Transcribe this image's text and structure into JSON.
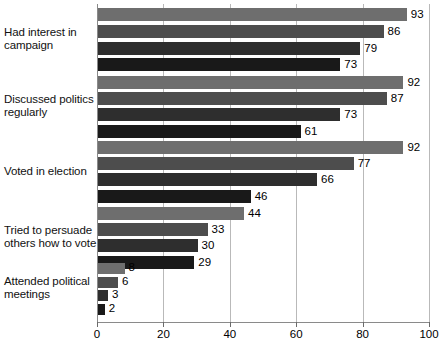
{
  "chart_data": {
    "type": "bar",
    "orientation": "horizontal",
    "title": "",
    "subtitle": "",
    "xlabel": "",
    "ylabel": "",
    "xlim": [
      0,
      100
    ],
    "xticks": [
      0,
      20,
      40,
      60,
      80,
      100
    ],
    "grid": true,
    "legend_position": "none",
    "categories": [
      "Had interest in campaign",
      "Discussed politics regularly",
      "Voted in election",
      "Tried to persuade others how to vote",
      "Attended political meetings"
    ],
    "category_lines": [
      [
        "Had interest in",
        "campaign"
      ],
      [
        "Discussed politics",
        "regularly"
      ],
      [
        "Voted in election"
      ],
      [
        "Tried to persuade",
        "others how to vote"
      ],
      [
        "Attended political",
        "meetings"
      ]
    ],
    "series": [
      {
        "name": "Series 1",
        "color": "#6e6e6e",
        "values": [
          93,
          92,
          92,
          44,
          8
        ]
      },
      {
        "name": "Series 2",
        "color": "#4d4d4d",
        "values": [
          86,
          87,
          77,
          33,
          6
        ]
      },
      {
        "name": "Series 3",
        "color": "#2e2e2e",
        "values": [
          79,
          73,
          66,
          30,
          3
        ]
      },
      {
        "name": "Series 4",
        "color": "#191919",
        "values": [
          73,
          61,
          46,
          29,
          2
        ]
      }
    ],
    "value_labels": [
      [
        93,
        86,
        79,
        73
      ],
      [
        92,
        87,
        73,
        61
      ],
      [
        92,
        77,
        66,
        46
      ],
      [
        44,
        33,
        30,
        29
      ],
      [
        8,
        6,
        3,
        2
      ]
    ],
    "tick_labels": [
      "0",
      "20",
      "40",
      "60",
      "80",
      "100"
    ],
    "axis_color": "#8a8a8a",
    "grid_color": "#b9b9b9",
    "background": "#ffffff"
  }
}
